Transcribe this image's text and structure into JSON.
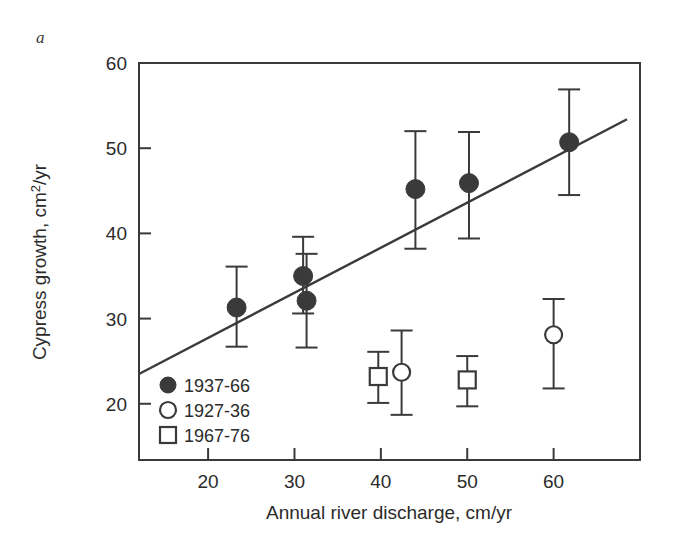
{
  "figure": {
    "panel_letter": "a",
    "background_color": "#ffffff",
    "ink_color": "#3a3a3a"
  },
  "chart_data": {
    "type": "scatter",
    "title": "",
    "xlabel": "Annual river discharge, cm/yr",
    "ylabel": "Cypress growth, cm²/yr",
    "xlim": [
      12,
      70
    ],
    "ylim": [
      13.4,
      60
    ],
    "xticks": [
      20,
      30,
      40,
      50,
      60
    ],
    "yticks": [
      20,
      30,
      40,
      50,
      60
    ],
    "xtick_labels": [
      "20",
      "30",
      "40",
      "50",
      "60"
    ],
    "ytick_labels": [
      "20",
      "30",
      "40",
      "50",
      "60"
    ],
    "grid": false,
    "legend_position": "bottom-left",
    "series": [
      {
        "name": "1937-66",
        "marker": "filled-circle",
        "color": "#3a3a3a",
        "points": [
          {
            "x": 23.3,
            "y": 31.3,
            "yerr_low": 26.7,
            "yerr_high": 36.1
          },
          {
            "x": 31.0,
            "y": 35.0,
            "yerr_low": 30.6,
            "yerr_high": 39.6
          },
          {
            "x": 31.4,
            "y": 32.1,
            "yerr_low": 26.6,
            "yerr_high": 37.6
          },
          {
            "x": 44.0,
            "y": 45.2,
            "yerr_low": 38.2,
            "yerr_high": 52.0
          },
          {
            "x": 50.2,
            "y": 45.9,
            "yerr_low": 39.4,
            "yerr_high": 51.9
          },
          {
            "x": 61.8,
            "y": 50.7,
            "yerr_low": 44.5,
            "yerr_high": 56.9
          }
        ]
      },
      {
        "name": "1927-36",
        "marker": "open-circle",
        "color": "#3a3a3a",
        "points": [
          {
            "x": 42.4,
            "y": 23.7,
            "yerr_low": 18.7,
            "yerr_high": 28.6
          },
          {
            "x": 60.0,
            "y": 28.1,
            "yerr_low": 21.8,
            "yerr_high": 32.3
          }
        ]
      },
      {
        "name": "1967-76",
        "marker": "open-square",
        "color": "#3a3a3a",
        "points": [
          {
            "x": 39.7,
            "y": 23.2,
            "yerr_low": 20.1,
            "yerr_high": 26.1
          },
          {
            "x": 50.0,
            "y": 22.8,
            "yerr_low": 19.7,
            "yerr_high": 25.6
          }
        ]
      }
    ],
    "trend_line": {
      "name": "regression-line",
      "x0": 12,
      "y0": 23.5,
      "x1": 68.5,
      "y1": 53.4,
      "color": "#3a3a3a"
    },
    "legend": [
      {
        "marker": "filled-circle",
        "label": "1937-66"
      },
      {
        "marker": "open-circle",
        "label": "1927-36"
      },
      {
        "marker": "open-square",
        "label": "1967-76"
      }
    ]
  }
}
